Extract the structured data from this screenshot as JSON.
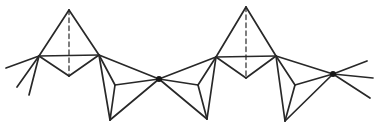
{
  "canvas": {
    "width": 376,
    "height": 126,
    "background": "#ffffff"
  },
  "diagram": {
    "type": "line-drawing",
    "stroke_color": "#282828",
    "stroke_width": 1.7,
    "dashed_color": "#484848",
    "dashed_width": 1.4,
    "dash_pattern": "4.5 3.5",
    "node_color": "#161616",
    "node_radius": 3,
    "points": {
      "uA_apex": [
        69,
        10
      ],
      "uA_left": [
        39,
        56
      ],
      "uA_right": [
        99,
        55
      ],
      "uA_front": [
        69,
        76
      ],
      "node1": [
        159,
        79
      ],
      "d1_bottom": [
        110,
        120
      ],
      "d1_back": [
        115,
        85
      ],
      "uB_left": [
        216,
        57
      ],
      "d2_bottom": [
        207,
        119
      ],
      "d2_back": [
        198,
        85
      ],
      "uB_apex": [
        246,
        7
      ],
      "uB_right": [
        276,
        56
      ],
      "uB_front": [
        246,
        78
      ],
      "node2": [
        333,
        74
      ],
      "d3_bottom": [
        285,
        121
      ],
      "d3_back": [
        295,
        85
      ],
      "tail_left_1": [
        6,
        68
      ],
      "tail_left_2": [
        17,
        87
      ],
      "tail_left_3": [
        29,
        95
      ],
      "tail_right_1": [
        367,
        61
      ],
      "tail_right_2": [
        373,
        78
      ],
      "tail_right_3": [
        370,
        98
      ]
    },
    "dashed_edges": [
      [
        "uA_apex",
        "uA_front"
      ],
      [
        "uB_apex",
        "uB_front"
      ]
    ],
    "solid_edges": [
      [
        "uA_apex",
        "uA_left"
      ],
      [
        "uA_apex",
        "uA_right"
      ],
      [
        "uA_left",
        "uA_right"
      ],
      [
        "uA_left",
        "uA_front"
      ],
      [
        "uA_right",
        "uA_front"
      ],
      [
        "uA_right",
        "node1"
      ],
      [
        "uA_right",
        "d1_bottom"
      ],
      [
        "d1_bottom",
        "node1"
      ],
      [
        "uA_right",
        "d1_back"
      ],
      [
        "d1_bottom",
        "d1_back"
      ],
      [
        "node1",
        "d1_back"
      ],
      [
        "node1",
        "uB_left"
      ],
      [
        "node1",
        "d2_bottom"
      ],
      [
        "d2_bottom",
        "uB_left"
      ],
      [
        "node1",
        "d2_back"
      ],
      [
        "d2_bottom",
        "d2_back"
      ],
      [
        "uB_left",
        "d2_back"
      ],
      [
        "uB_apex",
        "uB_left"
      ],
      [
        "uB_apex",
        "uB_right"
      ],
      [
        "uB_left",
        "uB_right"
      ],
      [
        "uB_left",
        "uB_front"
      ],
      [
        "uB_right",
        "uB_front"
      ],
      [
        "uB_right",
        "node2"
      ],
      [
        "uB_right",
        "d3_bottom"
      ],
      [
        "d3_bottom",
        "node2"
      ],
      [
        "uB_right",
        "d3_back"
      ],
      [
        "d3_bottom",
        "d3_back"
      ],
      [
        "node2",
        "d3_back"
      ],
      [
        "uA_left",
        "tail_left_1"
      ],
      [
        "uA_left",
        "tail_left_2"
      ],
      [
        "uA_left",
        "tail_left_3"
      ],
      [
        "node2",
        "tail_right_1"
      ],
      [
        "node2",
        "tail_right_2"
      ],
      [
        "node2",
        "tail_right_3"
      ]
    ],
    "nodes": [
      "node1",
      "node2"
    ]
  }
}
